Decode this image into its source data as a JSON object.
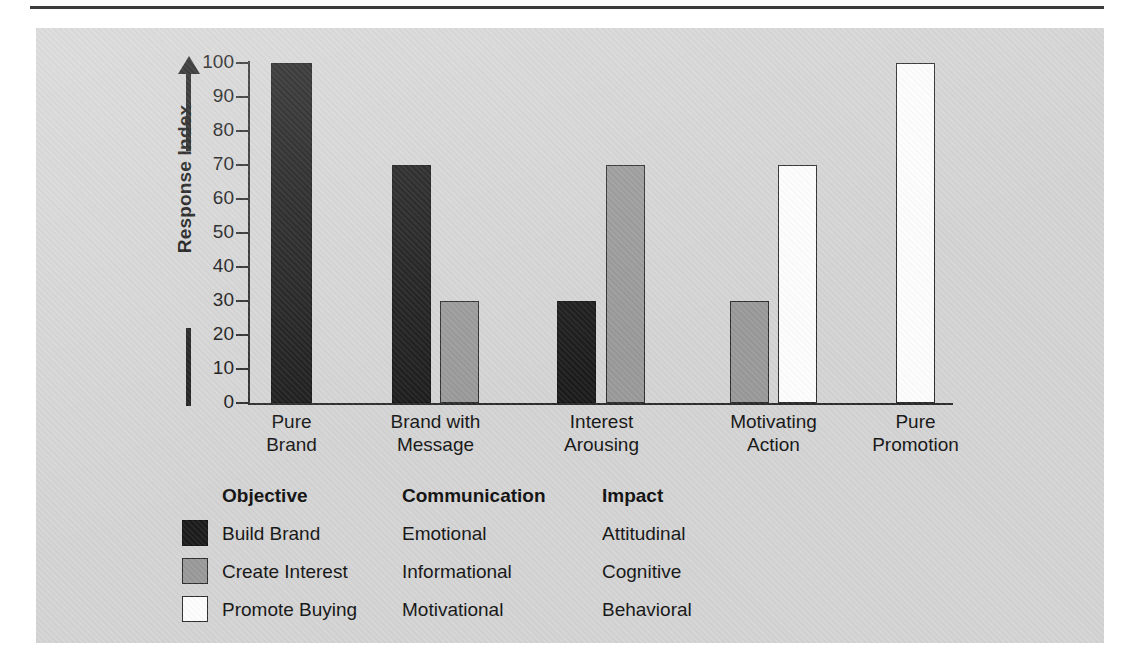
{
  "figure": {
    "panel_color": "#d4d4d4",
    "rule_color": "#3c3c3c"
  },
  "chart_data": {
    "type": "bar",
    "title": "",
    "xlabel": "",
    "ylabel": "Response Index",
    "ylim": [
      0,
      100
    ],
    "yticks": [
      0,
      10,
      20,
      30,
      40,
      50,
      60,
      70,
      80,
      90,
      100
    ],
    "ytick_labels": [
      "0",
      "10",
      "20",
      "30",
      "40",
      "50",
      "60",
      "70",
      "80",
      "90",
      "100"
    ],
    "grid": false,
    "legend_position": "bottom",
    "categories": [
      "Pure Brand",
      "Brand with Message",
      "Interest Arousing",
      "Motivating Action",
      "Pure Promotion"
    ],
    "category_lines": [
      [
        "Pure",
        "Brand"
      ],
      [
        "Brand with",
        "Message"
      ],
      [
        "Interest",
        "Arousing"
      ],
      [
        "Motivating",
        "Action"
      ],
      [
        "Pure",
        "Promotion"
      ]
    ],
    "series": [
      {
        "name": "Build Brand",
        "color": "#1b1b1b",
        "values": [
          100,
          70,
          30,
          0,
          0
        ]
      },
      {
        "name": "Create Interest",
        "color": "#999999",
        "values": [
          0,
          30,
          70,
          30,
          0
        ]
      },
      {
        "name": "Promote Buying",
        "color": "#ffffff",
        "values": [
          0,
          0,
          0,
          70,
          100
        ]
      }
    ]
  },
  "axis": {
    "y_title": "Response Index",
    "ticks": [
      "100",
      "90",
      "80",
      "70",
      "60",
      "50",
      "40",
      "30",
      "20",
      "10",
      "0"
    ]
  },
  "legend": {
    "headers": [
      "Objective",
      "Communication",
      "Impact"
    ],
    "rows": [
      {
        "swatch": "black",
        "objective": "Build Brand",
        "communication": "Emotional",
        "impact": "Attitudinal"
      },
      {
        "swatch": "gray",
        "objective": "Create Interest",
        "communication": "Informational",
        "impact": "Cognitive"
      },
      {
        "swatch": "white",
        "objective": "Promote Buying",
        "communication": "Motivational",
        "impact": "Behavioral"
      }
    ]
  }
}
